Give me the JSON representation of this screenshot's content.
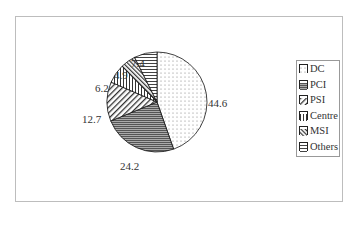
{
  "chart_data": {
    "type": "pie",
    "title": "",
    "categories": [
      "DC",
      "PCI",
      "PSI",
      "Centre",
      "MSI",
      "Others"
    ],
    "values": [
      44.6,
      24.2,
      12.7,
      6.2,
      4.9,
      7.4
    ],
    "labels": [
      "44.6",
      "24.2",
      "12.7",
      "6.2",
      "4.9",
      "7.4"
    ],
    "legend_position": "right"
  }
}
